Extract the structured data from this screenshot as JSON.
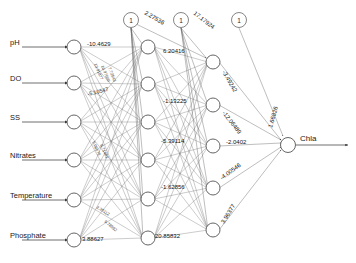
{
  "diagram": {
    "type": "neural-network",
    "title": "",
    "layers": {
      "input": {
        "label": "input-layer",
        "nodes": [
          {
            "id": "in-ph",
            "label": "pH"
          },
          {
            "id": "in-do",
            "label": "DO"
          },
          {
            "id": "in-ss",
            "label": "SS"
          },
          {
            "id": "in-nitrates",
            "label": "Nitrates"
          },
          {
            "id": "in-temperature",
            "label": "Temperature"
          },
          {
            "id": "in-phosphate",
            "label": "Phosphate"
          }
        ]
      },
      "hidden1": {
        "label": "hidden-layer-1",
        "node_count": 6
      },
      "hidden2": {
        "label": "hidden-layer-2",
        "node_count": 5
      },
      "output": {
        "label": "output-layer",
        "nodes": [
          {
            "id": "out-chla",
            "label": "Chla"
          }
        ]
      }
    },
    "bias_nodes": [
      {
        "id": "bias-1",
        "label": "1",
        "weight_label": "2.27536"
      },
      {
        "id": "bias-2",
        "label": "1",
        "weight_label": "17.17924"
      },
      {
        "id": "bias-3",
        "label": "1",
        "weight_label": ""
      }
    ],
    "weight_labels": {
      "ph_to_h1": "-10.4629",
      "do_to_h1": "-5.10547",
      "hidden1_top": "6.20416",
      "hidden1_second": "-1.13225",
      "hidden1_middle": "-5.39114",
      "hidden1_lower": "-1.62856",
      "phosphate_edge": "3.88627",
      "hidden1_bottom": "20.85832",
      "h2_top_out": "-3.49242",
      "h2_second_out": "-12.06489",
      "h2_middle_out": "-2.0402",
      "h2_fourth_out": "-4.00546",
      "h2_bottom_out": "3.96377",
      "bias_to_output": "1.66826",
      "cluster_a": "13.91877",
      "cluster_b": "10.97699",
      "cluster_c": "7.72543",
      "cluster_d": "9.08579",
      "cluster_e": "8.71482",
      "cluster_f": "2.35112",
      "cluster_g": "9.78592"
    }
  }
}
